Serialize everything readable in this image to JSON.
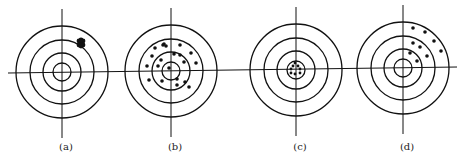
{
  "figure": {
    "stroke_color": "#111111",
    "background": "#ffffff",
    "targets": [
      {
        "id": "a",
        "label": "(a)",
        "center": [
          62,
          72
        ],
        "radii": [
          46,
          32,
          19,
          9
        ],
        "pattern": "tight cluster off-center (upper right)",
        "cluster": [
          81,
          43,
          5
        ],
        "dots": []
      },
      {
        "id": "b",
        "label": "(b)",
        "center": [
          171,
          71
        ],
        "radii": [
          46,
          32,
          19,
          9
        ],
        "pattern": "widely scattered around center",
        "dots": [
          [
            163,
            45
          ],
          [
            164,
            44
          ],
          [
            166,
            46
          ],
          [
            155,
            48
          ],
          [
            180,
            45
          ],
          [
            152,
            56
          ],
          [
            174,
            54
          ],
          [
            180,
            55
          ],
          [
            191,
            53
          ],
          [
            161,
            60
          ],
          [
            184,
            62
          ],
          [
            147,
            66
          ],
          [
            158,
            66
          ],
          [
            196,
            63
          ],
          [
            169,
            68
          ],
          [
            149,
            80
          ],
          [
            162,
            81
          ],
          [
            177,
            79
          ],
          [
            185,
            82
          ],
          [
            177,
            85
          ],
          [
            189,
            87
          ]
        ]
      },
      {
        "id": "c",
        "label": "(c)",
        "center": [
          296,
          70
        ],
        "radii": [
          46,
          32,
          19,
          9
        ],
        "pattern": "tight cluster at center",
        "dots": [
          [
            295,
            63
          ],
          [
            293,
            66
          ],
          [
            298,
            66
          ],
          [
            291,
            69
          ],
          [
            300,
            69
          ],
          [
            291,
            73
          ],
          [
            295,
            74
          ],
          [
            300,
            73
          ]
        ]
      },
      {
        "id": "d",
        "label": "(d)",
        "center": [
          403,
          68
        ],
        "radii": [
          46,
          32,
          19,
          9
        ],
        "pattern": "spread cluster off-center (upper right)",
        "dots": [
          [
            413,
            28
          ],
          [
            425,
            32
          ],
          [
            434,
            41
          ],
          [
            413,
            43
          ],
          [
            420,
            47
          ],
          [
            441,
            51
          ],
          [
            410,
            53
          ],
          [
            427,
            56
          ],
          [
            417,
            61
          ]
        ]
      }
    ]
  }
}
